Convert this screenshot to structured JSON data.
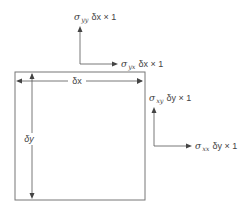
{
  "diagram": {
    "colors": {
      "line": "#555555",
      "text": "#444444",
      "background": "#ffffff"
    },
    "element": {
      "width_label": "δx",
      "height_label": "δy"
    },
    "forces": {
      "sigma_yy": {
        "symbol": "σ",
        "sub": "yy",
        "rest": "δx × 1"
      },
      "sigma_yx": {
        "symbol": "σ",
        "sub": "yx",
        "rest": "δx × 1"
      },
      "sigma_xy": {
        "symbol": "σ",
        "sub": "xy",
        "rest": "δy × 1"
      },
      "sigma_xx": {
        "symbol": "σ",
        "sub": "xx",
        "rest": "δy × 1"
      }
    }
  }
}
